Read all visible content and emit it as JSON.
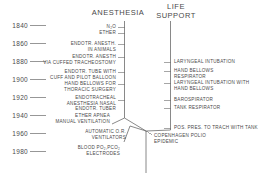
{
  "diagram": {
    "title_columns": [
      {
        "id": "anesthesia",
        "label": "ANESTHESIA"
      },
      {
        "id": "life-support",
        "label": "LIFE\nSUPPORT"
      }
    ],
    "axis": {
      "label": "",
      "years": [
        "1840",
        "1860",
        "1880",
        "1900",
        "1920",
        "1940",
        "1960",
        "1980"
      ]
    },
    "anesthesia_events": [
      {
        "id": "n2o",
        "text": "N₂O",
        "year": 1842
      },
      {
        "id": "ether",
        "text": "ETHER",
        "year": 1846
      },
      {
        "id": "endotr-anesth-animals",
        "text": "ENDOTR. ANESTH.\nIN ANIMALS",
        "year": 1858
      },
      {
        "id": "endotr-anesth-cuffed-tracheostomy",
        "text": "ENDOTR. ANESTH\nVIA CUFFED TRACHEOSTOMY",
        "year": 1878
      },
      {
        "id": "endotr-tube-cuff-pilot-balloon",
        "text": "ENDOTR. TUBE WITH\nCUFF AND PILOT BALLOON",
        "year": 1893
      },
      {
        "id": "hand-bellows-thoracic-surgery",
        "text": "HAND BELLOWS FOR\nTHORACIC SURGERY",
        "year": 1903
      },
      {
        "id": "endotracheal-anesthesia-nasal",
        "text": "ENDOTRACHEAL\nANESTHESIA NASAL\nENDOTR. TUBER",
        "year": 1920
      },
      {
        "id": "ether-apnea-manual-ventilation",
        "text": "ETHER APNEA\nMANUAL VENTILATION",
        "year": 1940
      },
      {
        "id": "automatic-or-ventilators",
        "text": "AUTOMATIC O.R.\nVENTILATORS",
        "year": 1952
      },
      {
        "id": "blood-po2-pco2-electrodes",
        "text": "BLOOD PO₂,PCO₂\nELECTRODES",
        "year": 1962
      }
    ],
    "life_support_events": [
      {
        "id": "laryngeal-intubation",
        "text": "LARYNGEAL INTUBATION",
        "year": 1880
      },
      {
        "id": "hand-bellows-respirator",
        "text": "HAND BELLOWS\nRESPIRATOR",
        "year": 1888
      },
      {
        "id": "laryngeal-intubation-hand-bellows",
        "text": "LARYNGEAL INTUBATION WITH\nHAND BELLOWS",
        "year": 1900
      },
      {
        "id": "barospirator",
        "text": "BAROSPIRATOR",
        "year": 1920
      },
      {
        "id": "tank-respirator",
        "text": "TANK RESPIRATOR",
        "year": 1928
      },
      {
        "id": "pos-pres-trach-tank",
        "text": "POS. PRES. TO TRACH WITH TANK",
        "year": 1948
      }
    ],
    "junction_events": [
      {
        "id": "copenhagen-polio-epidemic",
        "text": "COPENHAGEN POLIO\nEPIDEMIC",
        "year": 1952
      }
    ]
  },
  "colors": {
    "line": "#6b6b6b",
    "text": "#4a4a4a",
    "background": "#ffffff"
  }
}
